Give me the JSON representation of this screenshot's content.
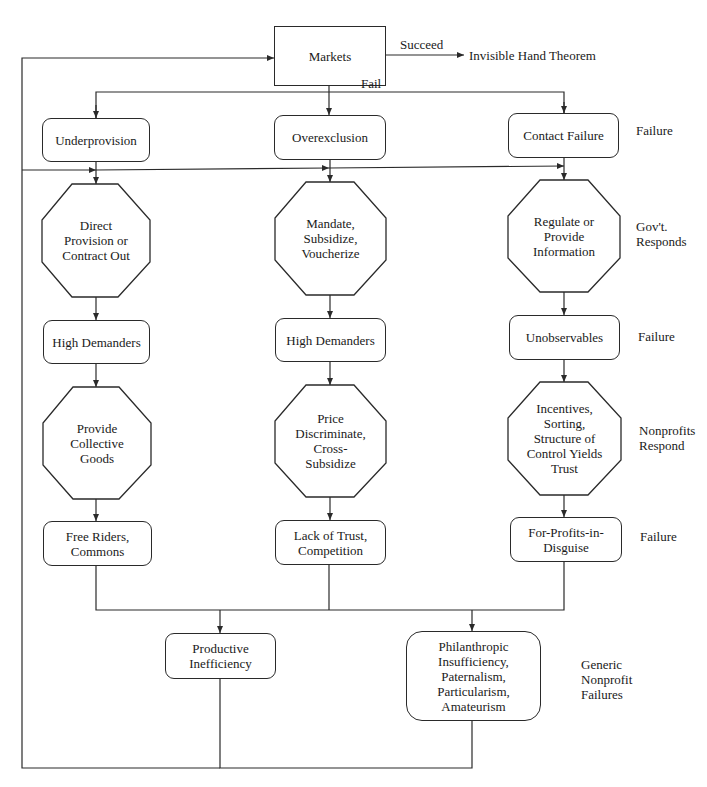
{
  "diagram": {
    "title": "",
    "start": {
      "label": "Markets"
    },
    "succeed_edge": {
      "label": "Succeed",
      "target": "Invisible Hand Theorem"
    },
    "fail_edge": {
      "label": "Fail"
    },
    "columns": [
      {
        "failure": "Underprovision",
        "gov_response": "Direct\nProvision or\nContract Out",
        "gov_failure": "High Demanders",
        "nonprofit_response": "Provide\nCollective\nGoods",
        "nonprofit_failure": "Free Riders,\nCommons"
      },
      {
        "failure": "Overexclusion",
        "gov_response": "Mandate,\nSubsidize,\nVoucherize",
        "gov_failure": "High Demanders",
        "nonprofit_response": "Price\nDiscriminate,\nCross-\nSubsidize",
        "nonprofit_failure": "Lack of Trust,\nCompetition"
      },
      {
        "failure": "Contact Failure",
        "gov_response": "Regulate or\nProvide\nInformation",
        "gov_failure": "Unobservables",
        "nonprofit_response": "Incentives,\nSorting,\nStructure of\nControl Yields\nTrust",
        "nonprofit_failure": "For-Profits-in-\nDisguise"
      }
    ],
    "generic_failures": [
      {
        "label": "Productive\nInefficiency"
      },
      {
        "label": "Philanthropic\nInsufficiency,\nPaternalism,\nParticularism,\nAmateurism"
      }
    ],
    "row_labels": {
      "failure_1": "Failure",
      "gov_responds": "Gov't.\nResponds",
      "failure_2": "Failure",
      "nonprofits_respond": "Nonprofits\nRespond",
      "failure_3": "Failure",
      "generic": "Generic\nNonprofit\nFailures"
    }
  },
  "colors": {
    "line": "#2a2a2a",
    "background": "#ffffff",
    "text": "#1a1a1a"
  }
}
